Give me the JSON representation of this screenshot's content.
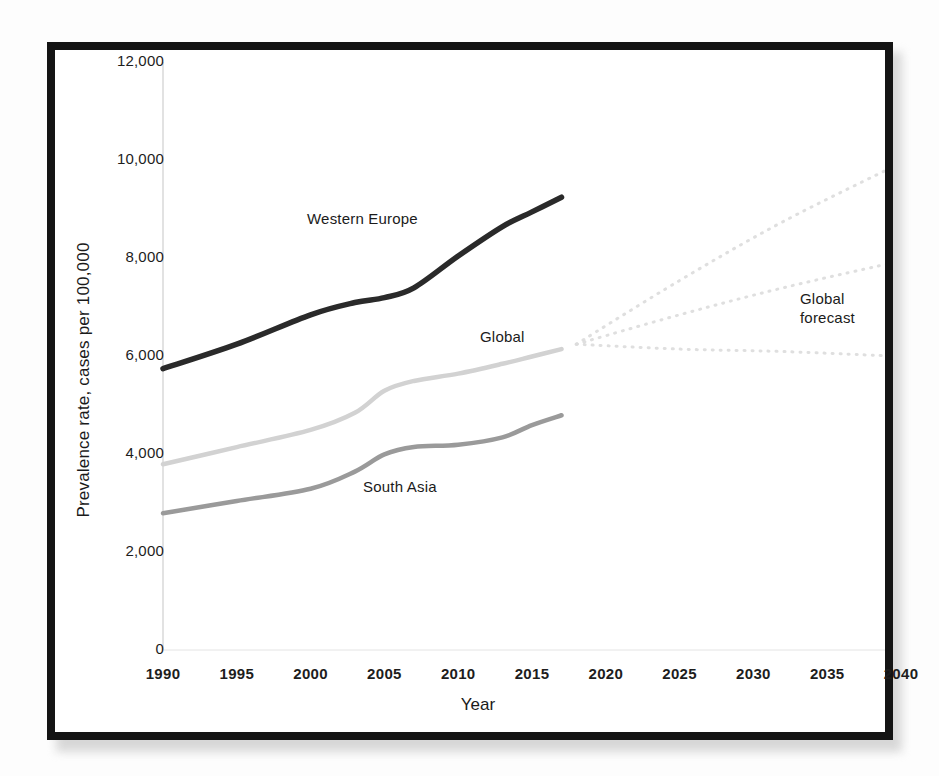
{
  "chart_data": {
    "type": "line",
    "title": "",
    "xlabel": "Year",
    "ylabel": "Prevalence rate, cases per 100,000",
    "xlim": [
      1990,
      2040
    ],
    "ylim": [
      0,
      12000
    ],
    "xticks": [
      "1990",
      "1995",
      "2000",
      "2005",
      "2010",
      "2015",
      "2020",
      "2025",
      "2030",
      "2035",
      "2040"
    ],
    "yticks": [
      "0",
      "2,000",
      "4,000",
      "6,000",
      "8,000",
      "10,000",
      "12,000"
    ],
    "grid": false,
    "legend": "inline annotations",
    "annotations": [
      {
        "text": "Western Europe",
        "x": 2002,
        "y": 8200
      },
      {
        "text": "Global",
        "x": 2013,
        "y": 6700
      },
      {
        "text": "South Asia",
        "x": 2006,
        "y": 3600
      },
      {
        "text": "Global\nforecast",
        "x": 2035,
        "y": 7000
      }
    ],
    "series": [
      {
        "name": "Western Europe",
        "style": "solid",
        "color": "#2a2a2a",
        "x": [
          1990,
          1995,
          2000,
          2003,
          2005,
          2007,
          2010,
          2013,
          2015,
          2017
        ],
        "values": [
          5700,
          6200,
          6800,
          7050,
          7150,
          7350,
          8000,
          8600,
          8900,
          9200
        ]
      },
      {
        "name": "Global",
        "style": "solid",
        "color": "#d2d2d2",
        "x": [
          1990,
          1995,
          2000,
          2003,
          2005,
          2007,
          2010,
          2013,
          2015,
          2017
        ],
        "values": [
          3750,
          4100,
          4450,
          4800,
          5250,
          5450,
          5600,
          5800,
          5950,
          6100
        ]
      },
      {
        "name": "South Asia",
        "style": "solid",
        "color": "#9a9a9a",
        "x": [
          1990,
          1995,
          2000,
          2003,
          2005,
          2007,
          2010,
          2013,
          2015,
          2017
        ],
        "values": [
          2750,
          3000,
          3250,
          3600,
          3950,
          4100,
          4150,
          4300,
          4550,
          4750
        ]
      },
      {
        "name": "Global forecast high",
        "style": "dotted",
        "color": "#dcdcdc",
        "x": [
          2018,
          2025,
          2032,
          2040
        ],
        "values": [
          6200,
          7500,
          8700,
          9900
        ]
      },
      {
        "name": "Global forecast mid",
        "style": "dotted",
        "color": "#dcdcdc",
        "x": [
          2018,
          2025,
          2032,
          2040
        ],
        "values": [
          6200,
          6800,
          7350,
          7900
        ]
      },
      {
        "name": "Global forecast low",
        "style": "dotted",
        "color": "#dcdcdc",
        "x": [
          2018,
          2025,
          2032,
          2040
        ],
        "values": [
          6200,
          6100,
          6050,
          5950
        ]
      }
    ]
  },
  "axis": {
    "x_title": "Year",
    "y_title": "Prevalence rate, cases per 100,000"
  },
  "notes": {
    "western_europe": "Western Europe",
    "global": "Global",
    "south_asia": "South Asia",
    "global_forecast": "Global\nforecast"
  }
}
